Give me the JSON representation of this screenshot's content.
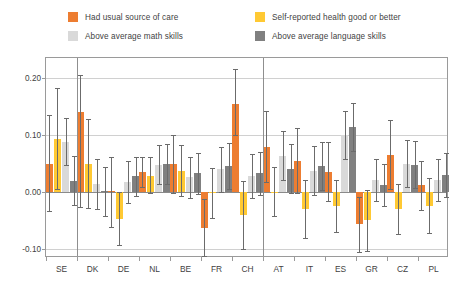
{
  "legend": {
    "items": [
      {
        "label": "Had usual source of care",
        "color": "#ED7D31",
        "key": "care"
      },
      {
        "label": "Self-reported health good or better",
        "color": "#FFC933",
        "key": "health"
      },
      {
        "label": "Above average math skills",
        "color": "#D9D9D9",
        "key": "math"
      },
      {
        "label": "Above average language skills",
        "color": "#808080",
        "key": "language"
      }
    ]
  },
  "axis": {
    "y_ticks": [
      "0.20",
      "0.10",
      "0.00",
      "-0.10"
    ],
    "y_values": [
      0.2,
      0.1,
      0.0,
      -0.1
    ],
    "ylim": [
      -0.115,
      0.235
    ]
  },
  "chart_data": {
    "type": "bar",
    "title": "",
    "xlabel": "",
    "ylabel": "",
    "ylim": [
      -0.115,
      0.235
    ],
    "grid": true,
    "legend_position": "top",
    "categories": [
      "SE",
      "DK",
      "DE",
      "NL",
      "BE",
      "FR",
      "CH",
      "AT",
      "IT",
      "ES",
      "GR",
      "CZ",
      "PL"
    ],
    "group_separators_after": [
      "SE",
      "CH"
    ],
    "series": [
      {
        "name": "Had usual source of care",
        "color": "#ED7D31",
        "values": [
          0.05,
          0.141,
          0.002,
          0.035,
          0.049,
          -0.062,
          0.155,
          0.08,
          0.055,
          0.036,
          -0.056,
          0.066,
          0.012
        ],
        "err_low": [
          -0.033,
          -0.026,
          -0.06,
          0.01,
          -0.002,
          -0.112,
          0.1,
          0.018,
          -0.001,
          -0.016,
          -0.104,
          0.006,
          -0.031
        ],
        "err_high": [
          0.135,
          0.205,
          0.062,
          0.062,
          0.1,
          -0.012,
          0.215,
          0.143,
          0.112,
          0.088,
          -0.009,
          0.127,
          0.054
        ]
      },
      {
        "name": "Self-reported health good or better",
        "color": "#FFC933",
        "values": [
          0.094,
          0.05,
          -0.046,
          0.029,
          0.038,
          -0.001,
          -0.04,
          0.001,
          -0.03,
          -0.024,
          -0.049,
          -0.029,
          -0.024
        ],
        "err_low": [
          0.006,
          -0.028,
          -0.093,
          -0.002,
          -0.006,
          -0.045,
          -0.1,
          -0.041,
          -0.08,
          -0.07,
          -0.103,
          -0.073,
          -0.072
        ],
        "err_high": [
          0.182,
          0.129,
          0.001,
          0.061,
          0.083,
          0.043,
          0.02,
          0.044,
          0.021,
          0.021,
          0.004,
          0.015,
          0.025
        ]
      },
      {
        "name": "Above average math skills",
        "color": "#D9D9D9",
        "values": [
          0.088,
          0.015,
          0.018,
          0.048,
          0.026,
          0.04,
          0.028,
          0.064,
          0.038,
          0.1,
          0.021,
          0.05,
          0.022
        ],
        "err_low": [
          0.047,
          -0.03,
          -0.018,
          0.014,
          -0.01,
          0.001,
          -0.01,
          0.022,
          -0.005,
          0.058,
          -0.016,
          0.009,
          -0.015
        ],
        "err_high": [
          0.13,
          0.059,
          0.054,
          0.083,
          0.062,
          0.079,
          0.067,
          0.107,
          0.081,
          0.143,
          0.058,
          0.092,
          0.059
        ]
      },
      {
        "name": "Above average language skills",
        "color": "#808080",
        "values": [
          0.02,
          0.002,
          0.028,
          0.049,
          0.033,
          0.046,
          0.033,
          0.041,
          0.046,
          0.114,
          0.013,
          0.048,
          0.03
        ],
        "err_low": [
          -0.023,
          -0.041,
          -0.006,
          0.014,
          -0.003,
          0.006,
          -0.005,
          -0.002,
          0.004,
          0.072,
          -0.024,
          0.007,
          -0.008
        ],
        "err_high": [
          0.063,
          0.045,
          0.062,
          0.084,
          0.069,
          0.086,
          0.071,
          0.084,
          0.088,
          0.157,
          0.05,
          0.089,
          0.068
        ]
      }
    ]
  }
}
